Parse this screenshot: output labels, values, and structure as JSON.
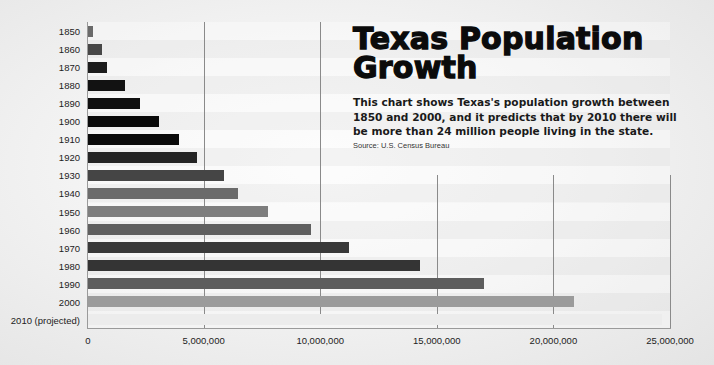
{
  "title": "Texas Population Growth",
  "description": "This chart shows Texas's population growth between 1850 and 2000, and it predicts that by 2010 there will be more than 24 million people living in the state.",
  "source": "Source: U.S. Census Bureau",
  "chart_data": {
    "type": "bar",
    "orientation": "horizontal",
    "title": "Texas Population Growth",
    "subtitle": "This chart shows Texas's population growth between 1850 and 2000, and it predicts that by 2010 there will be more than 24 million people living in the state.",
    "source": "Source: U.S. Census Bureau",
    "xlabel": "",
    "ylabel": "",
    "categories": [
      "1850",
      "1860",
      "1870",
      "1880",
      "1890",
      "1900",
      "1910",
      "1920",
      "1930",
      "1940",
      "1950",
      "1960",
      "1970",
      "1980",
      "1990",
      "2000",
      "2010 (projected)"
    ],
    "values": [
      212592,
      604215,
      818579,
      1591749,
      2235527,
      3048710,
      3896542,
      4663228,
      5824715,
      6414824,
      7711194,
      9579677,
      11196730,
      14229191,
      16986510,
      20851820,
      24600000
    ],
    "colors": [
      "#6a6a6a",
      "#474747",
      "#1c1c1c",
      "#121212",
      "#101010",
      "#090909",
      "#0b0b0b",
      "#242424",
      "#454545",
      "#6b6b6b",
      "#7e7e7e",
      "#5f5f5f",
      "#393939",
      "#343434",
      "#5d5d5d",
      "#9b9b9b",
      "#ececec"
    ],
    "xlim": [
      0,
      25000000
    ],
    "xticks": [
      0,
      5000000,
      10000000,
      15000000,
      20000000,
      25000000
    ],
    "xtick_labels": [
      "0",
      "5,000,000",
      "10,000,000",
      "15,000,000",
      "20,000,000",
      "25,000,000"
    ],
    "grid": "vertical",
    "legend": "none"
  }
}
